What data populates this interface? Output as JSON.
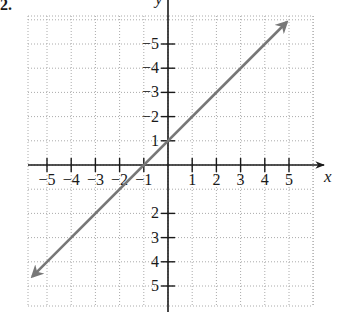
{
  "problem_label": "2.",
  "chart_data": {
    "type": "line",
    "title": "",
    "xlabel": "x",
    "ylabel": "y",
    "xlim": [
      -5.6,
      6
    ],
    "ylim": [
      -6,
      6.2
    ],
    "grid": true,
    "x_ticks": [
      -5,
      -4,
      -3,
      -2,
      -1,
      1,
      2,
      3,
      4,
      5
    ],
    "y_ticks": [
      -5,
      -4,
      -3,
      -2,
      1,
      2,
      3,
      4,
      5
    ],
    "x_tick_labels": [
      "−5",
      "−4",
      "−3",
      "−2",
      "−1",
      "1",
      "2",
      "3",
      "4",
      "5"
    ],
    "y_tick_labels": [
      "5",
      "4",
      "3",
      "2",
      "1",
      "−2",
      "−3",
      "−4",
      "−5"
    ],
    "series": [
      {
        "name": "y = x + 1",
        "equation": "y = x + 1",
        "slope": 1,
        "intercept": 1,
        "points": [
          [
            -5.6,
            -4.6
          ],
          [
            -1,
            0
          ],
          [
            0,
            1
          ],
          [
            4.9,
            5.9
          ]
        ],
        "arrows": "both",
        "color": "#777777"
      }
    ]
  },
  "colors": {
    "axis": "#1a1a1a",
    "grid": "#aaaaaa",
    "line": "#777777"
  }
}
